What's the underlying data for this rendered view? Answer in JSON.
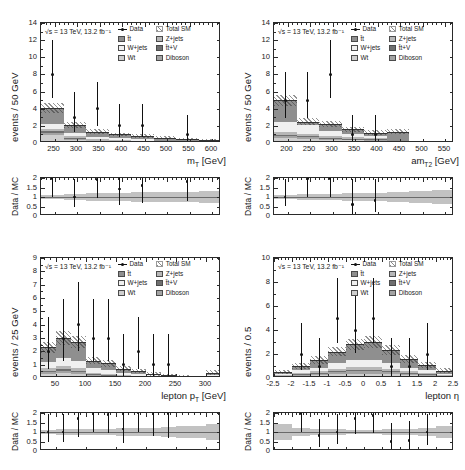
{
  "figure": {
    "lumi_text": "√s = 13 TeV, 13.2 fb⁻¹",
    "ratio_ylabel": "Data / MC",
    "caption": ""
  },
  "legend": {
    "entries": [
      {
        "key": "data",
        "label": "Data",
        "swatch": "data-marker",
        "color": "#111111"
      },
      {
        "key": "totalsm",
        "label": "Total SM",
        "swatch": "hatch",
        "color": "#3c3c3c"
      },
      {
        "key": "ttbar",
        "label": "t̄t",
        "swatch": "fill",
        "color": "#8f8f8f"
      },
      {
        "key": "zjets",
        "label": "Z+jets",
        "swatch": "fill",
        "color": "#b7b7b7"
      },
      {
        "key": "wjets",
        "label": "W+jets",
        "swatch": "fill",
        "color": "#f0f0f0"
      },
      {
        "key": "ttv",
        "label": "t̄t+V",
        "swatch": "fill",
        "color": "#6f6f6f"
      },
      {
        "key": "wt",
        "label": "Wt",
        "swatch": "fill",
        "color": "#cfcfcf"
      },
      {
        "key": "diboson",
        "label": "Diboson",
        "swatch": "fill",
        "color": "#a3a3a3"
      }
    ]
  },
  "chart_data": [
    {
      "id": "mt",
      "type": "bar",
      "title": "",
      "xlabel": "m_T [GeV]",
      "xlabel_base": "m",
      "xlabel_sub": "T",
      "xlabel_unit": "[GeV]",
      "ylabel": "events / 50 GeV",
      "xlim": [
        220,
        620
      ],
      "ylim": [
        0,
        14
      ],
      "xticks": [
        250,
        300,
        350,
        400,
        450,
        500,
        550,
        600
      ],
      "yticks": [
        0,
        2,
        4,
        6,
        8,
        10,
        12,
        14
      ],
      "bin_edges": [
        220,
        270,
        320,
        370,
        420,
        470,
        520,
        570,
        620
      ],
      "series": [
        {
          "name": "Wt",
          "values": [
            0.95,
            0.35,
            0.1,
            0.1,
            0.08,
            0.05,
            0.04,
            0.03
          ]
        },
        {
          "name": "Diboson",
          "values": [
            0.25,
            0.15,
            0.1,
            0.08,
            0.06,
            0.04,
            0.03,
            0.02
          ]
        },
        {
          "name": "t̄t+V",
          "values": [
            0.15,
            0.1,
            0.07,
            0.05,
            0.04,
            0.03,
            0.02,
            0.02
          ]
        },
        {
          "name": "Z+jets",
          "values": [
            0.3,
            0.25,
            0.15,
            0.1,
            0.08,
            0.05,
            0.04,
            0.03
          ]
        },
        {
          "name": "W+jets",
          "values": [
            0.55,
            0.35,
            0.25,
            0.2,
            0.15,
            0.1,
            0.08,
            0.05
          ]
        },
        {
          "name": "t̄t",
          "values": [
            1.9,
            0.85,
            0.63,
            0.47,
            0.39,
            0.33,
            0.29,
            0.25
          ]
        }
      ],
      "total_sm": [
        4.1,
        2.05,
        1.3,
        1.0,
        0.8,
        0.6,
        0.5,
        0.4
      ],
      "total_sm_err": [
        0.55,
        0.35,
        0.28,
        0.22,
        0.2,
        0.16,
        0.14,
        0.12
      ],
      "data": {
        "x": [
          245,
          295,
          345,
          395,
          445,
          495,
          545,
          595
        ],
        "y": [
          8,
          3,
          4,
          2,
          2,
          0,
          1,
          0
        ],
        "elo": [
          2.8,
          1.7,
          2.0,
          1.3,
          1.3,
          0.0,
          1.0,
          0.0
        ],
        "ehi": [
          4.0,
          2.9,
          3.1,
          2.6,
          2.6,
          0.0,
          2.3,
          0.0
        ]
      },
      "ratio": {
        "ylim": [
          0,
          2
        ],
        "yticks": [
          0,
          0.5,
          1,
          1.5,
          2
        ],
        "x": [
          245,
          295,
          345,
          395,
          445,
          495,
          545
        ],
        "y": [
          1.95,
          1.0,
          1.9,
          1.4,
          1.6,
          0.0,
          1.8
        ],
        "elo": [
          0.95,
          0.55,
          0.95,
          0.8,
          0.9,
          0.0,
          1.0
        ],
        "ehi": [
          0.05,
          0.95,
          0.1,
          0.6,
          0.4,
          0.0,
          0.2
        ],
        "band": [
          0.13,
          0.17,
          0.21,
          0.22,
          0.25,
          0.27,
          0.28,
          0.3
        ]
      }
    },
    {
      "id": "amt2",
      "type": "bar",
      "title": "",
      "xlabel": "am_T2 [GeV]",
      "xlabel_base": "am",
      "xlabel_sub": "T2",
      "xlabel_unit": "[GeV]",
      "ylabel": "events / 50 GeV",
      "xlim": [
        170,
        570
      ],
      "ylim": [
        0,
        14
      ],
      "xticks": [
        200,
        250,
        300,
        350,
        400,
        450,
        500,
        550
      ],
      "yticks": [
        0,
        2,
        4,
        6,
        8,
        10,
        12,
        14
      ],
      "bin_edges": [
        170,
        220,
        270,
        320,
        370,
        420,
        470,
        520,
        570
      ],
      "series": [
        {
          "name": "Wt",
          "values": [
            0.55,
            0.45,
            0.35,
            0.3,
            0.25,
            0.05,
            0.02,
            0.01
          ]
        },
        {
          "name": "Diboson",
          "values": [
            0.25,
            0.2,
            0.18,
            0.14,
            0.12,
            0.04,
            0.01,
            0.01
          ]
        },
        {
          "name": "t̄t+V",
          "values": [
            0.15,
            0.12,
            0.1,
            0.08,
            0.06,
            0.02,
            0.01,
            0.0
          ]
        },
        {
          "name": "Z+jets",
          "values": [
            0.3,
            0.28,
            0.22,
            0.18,
            0.12,
            0.03,
            0.01,
            0.0
          ]
        },
        {
          "name": "W+jets",
          "values": [
            1.2,
            1.1,
            0.55,
            0.4,
            0.25,
            0.06,
            0.01,
            0.0
          ]
        },
        {
          "name": "t̄t",
          "values": [
            2.55,
            0.35,
            0.8,
            0.5,
            0.4,
            1.1,
            0.04,
            0.0
          ]
        }
      ],
      "total_sm": [
        5.0,
        2.5,
        2.2,
        1.6,
        1.2,
        1.3,
        0.1,
        0.02
      ],
      "total_sm_err": [
        0.65,
        0.4,
        0.38,
        0.3,
        0.26,
        0.3,
        0.05,
        0.02
      ],
      "data": {
        "x": [
          195,
          245,
          295,
          345,
          395,
          445,
          495,
          545
        ],
        "y": [
          5,
          5,
          8,
          1,
          1,
          0,
          0,
          0
        ],
        "elo": [
          2.1,
          2.1,
          2.8,
          1.0,
          1.0,
          0.0,
          0.0,
          0.0
        ],
        "ehi": [
          3.3,
          3.3,
          4.0,
          2.3,
          2.3,
          0.0,
          0.0,
          0.0
        ]
      },
      "ratio": {
        "ylim": [
          0,
          2
        ],
        "yticks": [
          0,
          0.5,
          1,
          1.5,
          2
        ],
        "x": [
          195,
          245,
          295,
          345,
          395
        ],
        "y": [
          1.0,
          1.95,
          1.95,
          0.6,
          0.8
        ],
        "elo": [
          0.45,
          0.95,
          0.95,
          0.5,
          0.6
        ],
        "ehi": [
          0.95,
          0.05,
          0.05,
          1.35,
          1.15
        ],
        "band": [
          0.12,
          0.15,
          0.17,
          0.19,
          0.22,
          0.25,
          0.3,
          0.35
        ]
      }
    },
    {
      "id": "lepton_pt",
      "type": "bar",
      "title": "",
      "xlabel": "lepton p_T [GeV]",
      "xlabel_base": "lepton p",
      "xlabel_sub": "T",
      "xlabel_unit": "[GeV]",
      "ylabel": "events / 25 GeV",
      "xlim": [
        25,
        325
      ],
      "ylim": [
        0,
        9
      ],
      "xticks": [
        50,
        100,
        150,
        200,
        250,
        300
      ],
      "yticks": [
        0,
        1,
        2,
        3,
        4,
        5,
        6,
        7,
        8,
        9
      ],
      "bin_edges": [
        25,
        50,
        75,
        100,
        125,
        150,
        175,
        200,
        225,
        250,
        275,
        300,
        325
      ],
      "series": [
        {
          "name": "Wt",
          "values": [
            0.3,
            0.35,
            0.3,
            0.12,
            0.1,
            0.1,
            0.06,
            0.05,
            0.04,
            0.03,
            0.02,
            0.05
          ]
        },
        {
          "name": "Diboson",
          "values": [
            0.15,
            0.2,
            0.16,
            0.1,
            0.08,
            0.06,
            0.04,
            0.03,
            0.02,
            0.02,
            0.01,
            0.03
          ]
        },
        {
          "name": "t̄t+V",
          "values": [
            0.1,
            0.12,
            0.1,
            0.06,
            0.05,
            0.04,
            0.03,
            0.02,
            0.02,
            0.01,
            0.01,
            0.02
          ]
        },
        {
          "name": "Z+jets",
          "values": [
            0.2,
            0.25,
            0.2,
            0.1,
            0.08,
            0.06,
            0.04,
            0.03,
            0.02,
            0.02,
            0.01,
            0.03
          ]
        },
        {
          "name": "W+jets",
          "values": [
            0.45,
            0.55,
            0.5,
            0.35,
            0.3,
            0.15,
            0.1,
            0.07,
            0.05,
            0.04,
            0.02,
            0.07
          ]
        },
        {
          "name": "t̄t",
          "values": [
            1.1,
            1.53,
            1.44,
            0.57,
            0.49,
            0.29,
            0.23,
            0.1,
            0.05,
            0.03,
            0.03,
            0.2
          ]
        }
      ],
      "total_sm": [
        2.3,
        3.0,
        2.7,
        1.3,
        1.1,
        0.7,
        0.5,
        0.3,
        0.2,
        0.15,
        0.1,
        0.4
      ],
      "total_sm_err": [
        0.4,
        0.5,
        0.45,
        0.28,
        0.25,
        0.2,
        0.16,
        0.12,
        0.1,
        0.08,
        0.06,
        0.18
      ],
      "data": {
        "x": [
          37,
          62,
          87,
          112,
          137,
          162,
          187,
          212,
          237,
          262,
          287,
          312
        ],
        "y": [
          2,
          3,
          4,
          3,
          3,
          1,
          2,
          1,
          1,
          0,
          0,
          0
        ],
        "elo": [
          1.3,
          1.7,
          2.0,
          1.7,
          1.7,
          1.0,
          1.3,
          1.0,
          1.0,
          0.0,
          0.0,
          0.0
        ],
        "ehi": [
          2.6,
          2.9,
          3.2,
          2.9,
          2.9,
          2.3,
          2.6,
          2.3,
          2.3,
          0.0,
          0.0,
          0.0
        ]
      },
      "ratio": {
        "ylim": [
          0,
          2
        ],
        "yticks": [
          0,
          0.5,
          1,
          1.5,
          2
        ],
        "x": [
          37,
          62,
          87,
          112,
          137,
          162,
          187,
          212,
          237
        ],
        "y": [
          1.0,
          1.0,
          1.7,
          1.95,
          1.9,
          1.15,
          1.98,
          1.95,
          1.95
        ],
        "elo": [
          0.55,
          0.55,
          0.95,
          0.95,
          0.95,
          0.75,
          0.98,
          1.15,
          1.25
        ],
        "ehi": [
          0.95,
          0.95,
          0.3,
          0.05,
          0.1,
          0.85,
          0.02,
          0.05,
          0.05
        ],
        "band": [
          0.12,
          0.14,
          0.15,
          0.17,
          0.18,
          0.2,
          0.21,
          0.22,
          0.24,
          0.32,
          0.34,
          0.4
        ]
      }
    },
    {
      "id": "lepton_eta",
      "type": "bar",
      "title": "",
      "xlabel": "lepton η",
      "xlabel_base": "lepton η",
      "xlabel_sub": "",
      "xlabel_unit": "",
      "ylabel": "events / 0.5",
      "xlim": [
        -2.5,
        2.5
      ],
      "ylim": [
        0,
        10
      ],
      "xticks": [
        -2.5,
        -2,
        -1.5,
        -1,
        -0.5,
        0,
        0.5,
        1,
        1.5,
        2,
        2.5
      ],
      "yticks": [
        0,
        2,
        4,
        6,
        8,
        10
      ],
      "bin_edges": [
        -2.5,
        -2,
        -1.5,
        -1,
        -0.5,
        0,
        0.5,
        1,
        1.5,
        2,
        2.5
      ],
      "series": [
        {
          "name": "Wt",
          "values": [
            0.1,
            0.18,
            0.22,
            0.3,
            0.35,
            0.35,
            0.3,
            0.22,
            0.18,
            0.1
          ]
        },
        {
          "name": "Diboson",
          "values": [
            0.05,
            0.1,
            0.12,
            0.16,
            0.2,
            0.2,
            0.16,
            0.12,
            0.1,
            0.05
          ]
        },
        {
          "name": "t̄t+V",
          "values": [
            0.03,
            0.06,
            0.08,
            0.1,
            0.12,
            0.12,
            0.1,
            0.08,
            0.06,
            0.03
          ]
        },
        {
          "name": "Z+jets",
          "values": [
            0.05,
            0.1,
            0.14,
            0.2,
            0.25,
            0.25,
            0.2,
            0.14,
            0.1,
            0.05
          ]
        },
        {
          "name": "W+jets",
          "values": [
            0.1,
            0.2,
            0.3,
            0.45,
            0.55,
            0.58,
            0.45,
            0.3,
            0.22,
            0.12
          ]
        },
        {
          "name": "t̄t",
          "values": [
            0.17,
            0.36,
            0.64,
            0.99,
            1.33,
            1.5,
            1.09,
            0.74,
            0.44,
            0.25
          ]
        }
      ],
      "total_sm": [
        0.5,
        1.0,
        1.5,
        2.2,
        2.8,
        3.0,
        2.3,
        1.6,
        1.1,
        0.6
      ],
      "total_sm_err": [
        0.18,
        0.25,
        0.32,
        0.4,
        0.48,
        0.5,
        0.42,
        0.34,
        0.26,
        0.2
      ],
      "data": {
        "x": [
          -2.25,
          -1.75,
          -1.25,
          -0.75,
          -0.25,
          0.25,
          0.75,
          1.25,
          1.75,
          2.25
        ],
        "y": [
          0,
          2,
          1,
          5,
          4,
          5,
          1,
          1,
          2,
          0
        ],
        "elo": [
          0.0,
          1.3,
          1.0,
          2.1,
          1.9,
          2.1,
          1.0,
          1.0,
          1.3,
          0.0
        ],
        "ehi": [
          0.0,
          2.6,
          2.3,
          3.3,
          3.2,
          3.3,
          2.3,
          2.3,
          2.6,
          0.0
        ]
      },
      "ratio": {
        "ylim": [
          0,
          2
        ],
        "yticks": [
          0,
          0.5,
          1,
          1.5,
          2
        ],
        "x": [
          -1.75,
          -1.25,
          -0.75,
          -0.25,
          0.25,
          0.75,
          1.25,
          1.75
        ],
        "y": [
          1.95,
          0.8,
          1.0,
          1.7,
          1.85,
          0.5,
          0.55,
          1.0
        ],
        "elo": [
          0.95,
          0.6,
          0.65,
          0.8,
          0.9,
          0.45,
          0.5,
          0.7
        ],
        "ehi": [
          0.05,
          0.9,
          0.95,
          0.3,
          0.15,
          1.0,
          1.05,
          0.95
        ],
        "band": [
          0.4,
          0.2,
          0.16,
          0.14,
          0.12,
          0.12,
          0.14,
          0.16,
          0.2,
          0.34
        ]
      }
    }
  ]
}
